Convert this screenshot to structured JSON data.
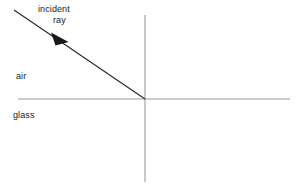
{
  "figure": {
    "background_color": "#ffffff",
    "width": 301,
    "height": 187
  },
  "labels": {
    "incident": "incident",
    "ray": "ray",
    "air": "air",
    "glass": "glass"
  },
  "colors": {
    "ray_stroke": "#2b2b2b",
    "axis_stroke": "#9a9a9a",
    "text": "#1a1a1a",
    "arrowhead_fill": "#1a1a1a"
  },
  "geometry": {
    "interface_line": {
      "name": "air-glass interface",
      "x1": 18,
      "y1": 99,
      "x2": 290,
      "y2": 99
    },
    "normal_line": {
      "name": "normal",
      "x1": 145,
      "y1": 15,
      "x2": 145,
      "y2": 182
    },
    "incident_ray": {
      "name": "incident ray",
      "x1": 14,
      "y1": 10,
      "x2": 145,
      "y2": 99
    },
    "arrowhead": {
      "name": "direction arrow on incident ray",
      "center_x": 59,
      "center_y": 38,
      "points": "51,33 68,42 56,45"
    },
    "incidence_point": {
      "x": 145,
      "y": 99
    }
  }
}
